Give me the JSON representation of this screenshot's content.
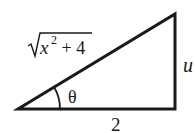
{
  "diagram": {
    "type": "right-triangle",
    "labels": {
      "hypotenuse_radical": "x",
      "hypotenuse_exponent": "2",
      "hypotenuse_rest": " + 4",
      "opposite": "u",
      "adjacent": "2",
      "angle": "θ"
    },
    "colors": {
      "stroke": "#1a1a1a",
      "background": "#ffffff"
    }
  }
}
